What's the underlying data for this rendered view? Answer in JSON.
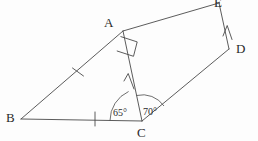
{
  "figure": {
    "kind": "geometry-diagram",
    "canvas": {
      "width": 258,
      "height": 141
    },
    "stroke_color": "#4a4a4a",
    "text_color": "#2a2a2a",
    "background_color": "#fdfdfd"
  },
  "vertices": [
    {
      "id": "A",
      "label": "A",
      "x": 123,
      "y": 31,
      "label_x": 104,
      "label_y": 16
    },
    {
      "id": "B",
      "label": "B",
      "x": 21,
      "y": 119,
      "label_x": 6,
      "label_y": 111
    },
    {
      "id": "C",
      "label": "C",
      "x": 142,
      "y": 121,
      "label_x": 137,
      "label_y": 126
    },
    {
      "id": "D",
      "label": "D",
      "x": 229,
      "y": 49,
      "label_x": 236,
      "label_y": 42
    },
    {
      "id": "E",
      "label": "E",
      "x": 219,
      "y": 3,
      "label_x": 214,
      "label_y": -4
    }
  ],
  "segments": [
    {
      "id": "BA",
      "from": "B",
      "to": "A",
      "ticks": 1
    },
    {
      "id": "AE",
      "from": "A",
      "to": "E",
      "ticks": 0
    },
    {
      "id": "ED",
      "from": "E",
      "to": "D",
      "ticks": 0
    },
    {
      "id": "DC",
      "from": "D",
      "to": "C",
      "ticks": 0
    },
    {
      "id": "CB",
      "from": "C",
      "to": "B",
      "ticks": 1
    },
    {
      "id": "CA",
      "from": "C",
      "to": "A",
      "ticks": 0
    }
  ],
  "tick_marks": [
    {
      "id": "tick-BA",
      "on": "BA",
      "x": 78,
      "y": 72
    },
    {
      "id": "tick-BC",
      "on": "CB",
      "x": 95,
      "y": 119
    }
  ],
  "arrow_marks": [
    {
      "id": "arrow-CA",
      "on": "CA",
      "x": 129,
      "y": 82,
      "direction": "toward-A"
    },
    {
      "id": "arrow-DE",
      "on": "ED",
      "x": 228,
      "y": 32,
      "direction": "toward-E"
    }
  ],
  "angles": [
    {
      "id": "angle-BCA",
      "vertex": "C",
      "value": "65",
      "unit": "°",
      "label": "65°",
      "label_x": 113,
      "label_y": 108,
      "radius": 32
    },
    {
      "id": "angle-ACD",
      "vertex": "C",
      "value": "70",
      "unit": "°",
      "label": "70°",
      "label_x": 143,
      "label_y": 107,
      "radius": 26
    }
  ],
  "right_angle": {
    "id": "right-angle-A",
    "vertex": "A",
    "label": "",
    "size": 17
  }
}
